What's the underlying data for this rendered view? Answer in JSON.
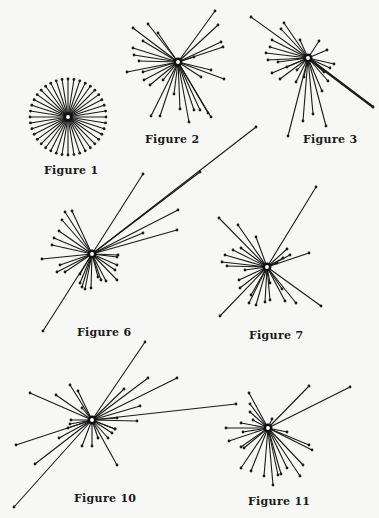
{
  "page": {
    "background": "#f7f7f5",
    "ink": "#1a1a1a"
  },
  "figures": [
    {
      "id": "fig1",
      "label": "Figure 1",
      "center": [
        68,
        117
      ],
      "label_pos": [
        44,
        164
      ],
      "spokes": {
        "mode": "uniform",
        "count": 40,
        "radius": 38,
        "start_deg": 0
      }
    },
    {
      "id": "fig2",
      "label": "Figure 2",
      "center": [
        178,
        62
      ],
      "label_pos": [
        145,
        133
      ],
      "spokes": {
        "mode": "list",
        "ends": [
          [
            133,
            28
          ],
          [
            148,
            24
          ],
          [
            158,
            33
          ],
          [
            143,
            41
          ],
          [
            133,
            48
          ],
          [
            134,
            55
          ],
          [
            139,
            61
          ],
          [
            127,
            72
          ],
          [
            143,
            72
          ],
          [
            144,
            80
          ],
          [
            150,
            85
          ],
          [
            163,
            80
          ],
          [
            151,
            116
          ],
          [
            160,
            116
          ],
          [
            174,
            94
          ],
          [
            180,
            109
          ],
          [
            189,
            122
          ],
          [
            194,
            110
          ],
          [
            200,
            110
          ],
          [
            208,
            113
          ],
          [
            211,
            117
          ],
          [
            211,
            70
          ],
          [
            224,
            79
          ],
          [
            201,
            77
          ],
          [
            223,
            47
          ],
          [
            221,
            42
          ],
          [
            218,
            25
          ],
          [
            215,
            11
          ],
          [
            194,
            57
          ]
        ]
      }
    },
    {
      "id": "fig3",
      "label": "Figure 3",
      "center": [
        308,
        58
      ],
      "label_pos": [
        303,
        133
      ],
      "spokes": {
        "mode": "list",
        "ends": [
          [
            251,
            17
          ],
          [
            284,
            23
          ],
          [
            281,
            29
          ],
          [
            272,
            40
          ],
          [
            270,
            47
          ],
          [
            266,
            53
          ],
          [
            268,
            60
          ],
          [
            278,
            62
          ],
          [
            272,
            73
          ],
          [
            280,
            79
          ],
          [
            287,
            67
          ],
          [
            297,
            70
          ],
          [
            296,
            82
          ],
          [
            304,
            77
          ],
          [
            288,
            136
          ],
          [
            303,
            121
          ],
          [
            313,
            114
          ],
          [
            326,
            126
          ],
          [
            322,
            91
          ],
          [
            328,
            81
          ],
          [
            324,
            72
          ],
          [
            330,
            68
          ],
          [
            334,
            64
          ],
          [
            327,
            50
          ],
          [
            319,
            41
          ],
          [
            300,
            40
          ],
          [
            373,
            107
          ]
        ],
        "thick": [
          26
        ]
      }
    },
    {
      "id": "fig6",
      "label": "Figure 6",
      "center": [
        92,
        254
      ],
      "label_pos": [
        77,
        326
      ],
      "spokes": {
        "mode": "list",
        "ends": [
          [
            65,
            212
          ],
          [
            72,
            211
          ],
          [
            62,
            220
          ],
          [
            59,
            231
          ],
          [
            54,
            238
          ],
          [
            52,
            245
          ],
          [
            42,
            259
          ],
          [
            60,
            265
          ],
          [
            57,
            272
          ],
          [
            65,
            272
          ],
          [
            80,
            274
          ],
          [
            80,
            283
          ],
          [
            82,
            287
          ],
          [
            85,
            289
          ],
          [
            91,
            288
          ],
          [
            98,
            277
          ],
          [
            101,
            280
          ],
          [
            106,
            281
          ],
          [
            117,
            280
          ],
          [
            115,
            270
          ],
          [
            117,
            265
          ],
          [
            117,
            257
          ],
          [
            118,
            255
          ],
          [
            143,
            233
          ],
          [
            178,
            210
          ],
          [
            177,
            230
          ],
          [
            143,
            174
          ],
          [
            200,
            172
          ],
          [
            256,
            127
          ],
          [
            43,
            331
          ]
        ]
      }
    },
    {
      "id": "fig7",
      "label": "Figure 7",
      "center": [
        267,
        267
      ],
      "label_pos": [
        249,
        329
      ],
      "spokes": {
        "mode": "list",
        "ends": [
          [
            219,
            218
          ],
          [
            238,
            225
          ],
          [
            256,
            237
          ],
          [
            241,
            248
          ],
          [
            233,
            250
          ],
          [
            225,
            255
          ],
          [
            222,
            262
          ],
          [
            227,
            266
          ],
          [
            245,
            270
          ],
          [
            239,
            280
          ],
          [
            240,
            288
          ],
          [
            251,
            295
          ],
          [
            249,
            303
          ],
          [
            256,
            305
          ],
          [
            265,
            302
          ],
          [
            270,
            300
          ],
          [
            285,
            301
          ],
          [
            296,
            303
          ],
          [
            321,
            306
          ],
          [
            270,
            283
          ],
          [
            282,
            289
          ],
          [
            277,
            263
          ],
          [
            283,
            258
          ],
          [
            290,
            255
          ],
          [
            309,
            253
          ],
          [
            287,
            249
          ],
          [
            316,
            187
          ],
          [
            220,
            316
          ]
        ]
      }
    },
    {
      "id": "fig10",
      "label": "Figure 10",
      "center": [
        92,
        420
      ],
      "label_pos": [
        74,
        492
      ],
      "spokes": {
        "mode": "list",
        "ends": [
          [
            30,
            393
          ],
          [
            56,
            395
          ],
          [
            70,
            385
          ],
          [
            78,
            391
          ],
          [
            82,
            408
          ],
          [
            71,
            420
          ],
          [
            70,
            424
          ],
          [
            68,
            428
          ],
          [
            16,
            445
          ],
          [
            59,
            438
          ],
          [
            35,
            464
          ],
          [
            14,
            507
          ],
          [
            82,
            446
          ],
          [
            92,
            446
          ],
          [
            98,
            438
          ],
          [
            108,
            438
          ],
          [
            112,
            433
          ],
          [
            115,
            429
          ],
          [
            117,
            418
          ],
          [
            115,
            429
          ],
          [
            117,
            465
          ],
          [
            137,
            421
          ],
          [
            140,
            406
          ],
          [
            148,
            378
          ],
          [
            124,
            389
          ],
          [
            177,
            378
          ],
          [
            236,
            404
          ],
          [
            145,
            342
          ]
        ]
      }
    },
    {
      "id": "fig11",
      "label": "Figure 11",
      "center": [
        268,
        428
      ],
      "label_pos": [
        248,
        495
      ],
      "spokes": {
        "mode": "list",
        "ends": [
          [
            249,
            393
          ],
          [
            250,
            404
          ],
          [
            250,
            412
          ],
          [
            253,
            420
          ],
          [
            241,
            423
          ],
          [
            226,
            428
          ],
          [
            243,
            432
          ],
          [
            229,
            441
          ],
          [
            241,
            447
          ],
          [
            244,
            448
          ],
          [
            241,
            468
          ],
          [
            251,
            471
          ],
          [
            264,
            476
          ],
          [
            273,
            485
          ],
          [
            278,
            475
          ],
          [
            281,
            474
          ],
          [
            287,
            468
          ],
          [
            300,
            476
          ],
          [
            303,
            465
          ],
          [
            309,
            445
          ],
          [
            312,
            450
          ],
          [
            287,
            432
          ],
          [
            272,
            419
          ],
          [
            309,
            386
          ],
          [
            350,
            387
          ]
        ]
      }
    }
  ]
}
